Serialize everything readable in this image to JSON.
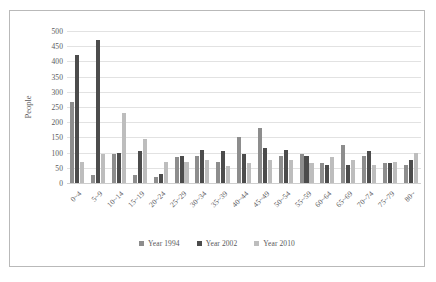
{
  "chart_data": {
    "type": "bar",
    "title": "",
    "subtitle": "",
    "xlabel": "",
    "ylabel": "People",
    "ylim": [
      0,
      500
    ],
    "ytick_step": 50,
    "yticks": [
      "500",
      "450",
      "400",
      "350",
      "300",
      "250",
      "200",
      "150",
      "100",
      "50",
      "0"
    ],
    "grid": true,
    "legend_position": "bottom",
    "categories": [
      "0~4",
      "5~9",
      "10~14",
      "15~19",
      "20~24",
      "25~29",
      "30~34",
      "35~39",
      "40~44",
      "45~49",
      "50~54",
      "55~59",
      "60~64",
      "65~69",
      "70~74",
      "75~79",
      "80~"
    ],
    "series": [
      {
        "name": "Year 1994",
        "color": "#8d8d8d",
        "values": [
          265,
          25,
          95,
          25,
          20,
          85,
          90,
          70,
          150,
          180,
          90,
          95,
          65,
          125,
          90,
          65,
          60
        ]
      },
      {
        "name": "Year 2002",
        "color": "#4c4c4c",
        "values": [
          420,
          470,
          100,
          105,
          30,
          90,
          110,
          105,
          95,
          115,
          110,
          90,
          60,
          60,
          105,
          65,
          75
        ]
      },
      {
        "name": "Year 2010",
        "color": "#bdbdbd",
        "values": [
          70,
          95,
          230,
          145,
          70,
          70,
          75,
          55,
          65,
          75,
          75,
          65,
          85,
          75,
          60,
          70,
          100
        ]
      }
    ]
  },
  "legend": {
    "items": [
      {
        "label": "Year 1994",
        "color": "#8d8d8d"
      },
      {
        "label": "Year 2002",
        "color": "#4c4c4c"
      },
      {
        "label": "Year 2010",
        "color": "#bdbdbd"
      }
    ]
  }
}
